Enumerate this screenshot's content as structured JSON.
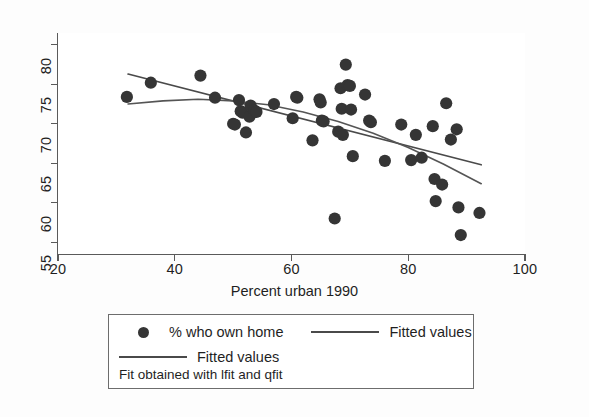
{
  "chart_data": {
    "type": "scatter",
    "title": "",
    "xlabel": "Percent urban 1990",
    "ylabel": "",
    "xlim": [
      20,
      100
    ],
    "ylim": [
      53.5,
      81.5
    ],
    "xticks": [
      20,
      40,
      60,
      80,
      100
    ],
    "yticks": [
      55,
      60,
      65,
      70,
      75,
      80
    ],
    "grid": false,
    "legend_position": "below-axes",
    "series": [
      {
        "name": "% who own home",
        "type": "scatter",
        "marker": "filled-circle",
        "color": "#353535",
        "points": [
          [
            31.8,
            73.4
          ],
          [
            35.9,
            75.2
          ],
          [
            44.4,
            76.1
          ],
          [
            46.9,
            73.3
          ],
          [
            50.0,
            70.0
          ],
          [
            50.3,
            69.9
          ],
          [
            51.0,
            73.0
          ],
          [
            51.3,
            71.6
          ],
          [
            51.6,
            71.4
          ],
          [
            52.2,
            68.9
          ],
          [
            52.8,
            70.9
          ],
          [
            53.0,
            72.3
          ],
          [
            53.6,
            71.7
          ],
          [
            54.0,
            71.5
          ],
          [
            57.0,
            72.5
          ],
          [
            60.2,
            70.7
          ],
          [
            60.8,
            73.4
          ],
          [
            61.0,
            73.3
          ],
          [
            63.6,
            67.9
          ],
          [
            64.8,
            73.1
          ],
          [
            65.0,
            72.7
          ],
          [
            65.2,
            70.4
          ],
          [
            65.5,
            70.3
          ],
          [
            67.4,
            58.0
          ],
          [
            68.0,
            69.0
          ],
          [
            68.4,
            74.5
          ],
          [
            68.6,
            71.9
          ],
          [
            68.8,
            68.6
          ],
          [
            69.3,
            77.5
          ],
          [
            69.6,
            74.9
          ],
          [
            70.0,
            74.8
          ],
          [
            70.2,
            71.8
          ],
          [
            70.5,
            65.9
          ],
          [
            72.6,
            73.7
          ],
          [
            73.3,
            70.4
          ],
          [
            73.6,
            70.2
          ],
          [
            76.0,
            65.3
          ],
          [
            78.8,
            69.9
          ],
          [
            80.5,
            65.4
          ],
          [
            81.3,
            68.6
          ],
          [
            82.3,
            65.7
          ],
          [
            84.2,
            69.7
          ],
          [
            84.5,
            63.0
          ],
          [
            84.7,
            60.2
          ],
          [
            85.8,
            62.3
          ],
          [
            86.5,
            72.6
          ],
          [
            87.3,
            68.0
          ],
          [
            88.3,
            69.3
          ],
          [
            88.6,
            59.4
          ],
          [
            89.0,
            55.9
          ],
          [
            92.2,
            58.7
          ]
        ]
      },
      {
        "name": "Fitted values",
        "type": "line",
        "fit": "linear",
        "color": "#4a4a4a",
        "points": [
          [
            32.0,
            76.3
          ],
          [
            92.5,
            64.8
          ]
        ]
      },
      {
        "name": "Fitted values",
        "type": "line",
        "fit": "quadratic",
        "color": "#555555",
        "points": [
          [
            32.0,
            72.5
          ],
          [
            38.0,
            72.9
          ],
          [
            44.0,
            73.1
          ],
          [
            50.0,
            72.9
          ],
          [
            56.0,
            72.4
          ],
          [
            62.0,
            71.5
          ],
          [
            68.0,
            70.3
          ],
          [
            74.0,
            68.8
          ],
          [
            80.0,
            67.0
          ],
          [
            86.0,
            64.9
          ],
          [
            92.5,
            62.4
          ]
        ]
      }
    ]
  },
  "axes": {
    "x_title": "Percent urban 1990",
    "x_tick_labels": [
      "20",
      "40",
      "60",
      "80",
      "100"
    ],
    "y_tick_labels": [
      "55",
      "60",
      "65",
      "70",
      "75",
      "80"
    ]
  },
  "legend": {
    "scatter_label": "% who own home",
    "line1_label": "Fitted values",
    "line2_label": "Fitted values",
    "note": "Fit obtained with lfit and qfit"
  },
  "colors": {
    "marker": "#353535",
    "line": "#4a4a4a",
    "axis": "#5a5a5a",
    "text": "#1f1f1f",
    "background": "#ffffff"
  }
}
